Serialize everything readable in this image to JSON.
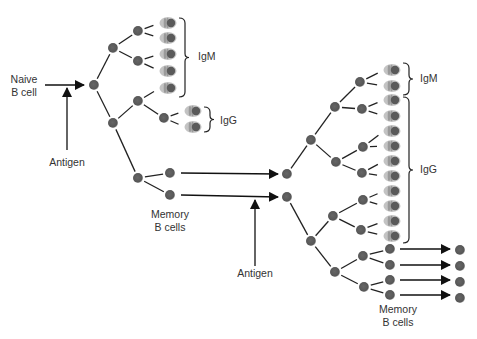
{
  "colors": {
    "node": "#5c5c5c",
    "plasma_body": "#bdbdbd",
    "plasma_stripe": "#9a9a9a",
    "plasma_nucleus": "#5a5a5a",
    "line": "#222222",
    "text": "#333333"
  },
  "labels": [
    {
      "id": "naive-label-1",
      "text": "Naive",
      "x": 24,
      "y": 83
    },
    {
      "id": "naive-label-2",
      "text": "B cell",
      "x": 24,
      "y": 96
    },
    {
      "id": "antigen-label-1",
      "text": "Antigen",
      "x": 67,
      "y": 166
    },
    {
      "id": "igm-label-1",
      "text": "IgM",
      "x": 198,
      "y": 60
    },
    {
      "id": "igg-label-1",
      "text": "IgG",
      "x": 220,
      "y": 124
    },
    {
      "id": "memory-label-1",
      "text": "Memory",
      "x": 170,
      "y": 218
    },
    {
      "id": "bcells-label-1",
      "text": "B cells",
      "x": 170,
      "y": 231
    },
    {
      "id": "antigen-label-2",
      "text": "Antigen",
      "x": 255,
      "y": 277
    },
    {
      "id": "igm-label-2",
      "text": "IgM",
      "x": 420,
      "y": 82
    },
    {
      "id": "igg-label-2",
      "text": "IgG",
      "x": 420,
      "y": 173
    },
    {
      "id": "memory-label-2",
      "text": "Memory",
      "x": 398,
      "y": 313
    },
    {
      "id": "bcells-label-2",
      "text": "B cells",
      "x": 398,
      "y": 326
    }
  ],
  "nodes": [
    {
      "id": "naive-b-cell",
      "x": 94,
      "y": 85
    },
    {
      "id": "p1",
      "x": 113,
      "y": 48
    },
    {
      "id": "p2",
      "x": 138,
      "y": 31
    },
    {
      "id": "p3",
      "x": 138,
      "y": 61
    },
    {
      "id": "p4",
      "x": 113,
      "y": 123
    },
    {
      "id": "p5",
      "x": 138,
      "y": 101
    },
    {
      "id": "p6",
      "x": 164,
      "y": 118
    },
    {
      "id": "m-parent",
      "x": 138,
      "y": 178
    },
    {
      "id": "memory-1a",
      "x": 170,
      "y": 173
    },
    {
      "id": "memory-1b",
      "x": 170,
      "y": 195
    },
    {
      "id": "s-top",
      "x": 287,
      "y": 174
    },
    {
      "id": "s-bot",
      "x": 287,
      "y": 197
    },
    {
      "id": "s1",
      "x": 311,
      "y": 140
    },
    {
      "id": "s2",
      "x": 335,
      "y": 107
    },
    {
      "id": "s3",
      "x": 360,
      "y": 82
    },
    {
      "id": "s4",
      "x": 362,
      "y": 109
    },
    {
      "id": "s5",
      "x": 336,
      "y": 162
    },
    {
      "id": "s6",
      "x": 363,
      "y": 147
    },
    {
      "id": "s7",
      "x": 362,
      "y": 173
    },
    {
      "id": "s8",
      "x": 311,
      "y": 241
    },
    {
      "id": "s9",
      "x": 333,
      "y": 216
    },
    {
      "id": "s10",
      "x": 363,
      "y": 200
    },
    {
      "id": "s11",
      "x": 361,
      "y": 230
    },
    {
      "id": "s12",
      "x": 335,
      "y": 272
    },
    {
      "id": "s13",
      "x": 363,
      "y": 256
    },
    {
      "id": "s14",
      "x": 364,
      "y": 287
    },
    {
      "id": "memory-2a",
      "x": 390,
      "y": 249
    },
    {
      "id": "memory-2b",
      "x": 390,
      "y": 265
    },
    {
      "id": "memory-2c",
      "x": 390,
      "y": 280
    },
    {
      "id": "memory-2d",
      "x": 390,
      "y": 295
    },
    {
      "id": "memory-3a",
      "x": 460,
      "y": 250
    },
    {
      "id": "memory-3b",
      "x": 460,
      "y": 266
    },
    {
      "id": "memory-3c",
      "x": 460,
      "y": 282
    },
    {
      "id": "memory-3d",
      "x": 460,
      "y": 298
    }
  ],
  "plasma_cells": [
    {
      "id": "pc1",
      "x": 168,
      "y": 23,
      "class": "IgM"
    },
    {
      "id": "pc2",
      "x": 168,
      "y": 38,
      "class": "IgM"
    },
    {
      "id": "pc3",
      "x": 168,
      "y": 54,
      "class": "IgM"
    },
    {
      "id": "pc4",
      "x": 168,
      "y": 71,
      "class": "IgM"
    },
    {
      "id": "pc5",
      "x": 168,
      "y": 88,
      "class": "IgM"
    },
    {
      "id": "pc6",
      "x": 193,
      "y": 111,
      "class": "IgG"
    },
    {
      "id": "pc7",
      "x": 193,
      "y": 127,
      "class": "IgG"
    },
    {
      "id": "pc8",
      "x": 392,
      "y": 70,
      "class": "IgM"
    },
    {
      "id": "pc9",
      "x": 392,
      "y": 86,
      "class": "IgM"
    },
    {
      "id": "pc10",
      "x": 392,
      "y": 100,
      "class": "IgG"
    },
    {
      "id": "pc11",
      "x": 392,
      "y": 116,
      "class": "IgG"
    },
    {
      "id": "pc12",
      "x": 392,
      "y": 131,
      "class": "IgG"
    },
    {
      "id": "pc13",
      "x": 392,
      "y": 146,
      "class": "IgG"
    },
    {
      "id": "pc14",
      "x": 392,
      "y": 161,
      "class": "IgG"
    },
    {
      "id": "pc15",
      "x": 392,
      "y": 176,
      "class": "IgG"
    },
    {
      "id": "pc16",
      "x": 392,
      "y": 191,
      "class": "IgG"
    },
    {
      "id": "pc17",
      "x": 392,
      "y": 206,
      "class": "IgG"
    },
    {
      "id": "pc18",
      "x": 392,
      "y": 221,
      "class": "IgG"
    },
    {
      "id": "pc19",
      "x": 392,
      "y": 236,
      "class": "IgG"
    }
  ],
  "edges": [
    [
      94,
      85,
      113,
      48
    ],
    [
      113,
      48,
      138,
      31
    ],
    [
      113,
      48,
      138,
      61
    ],
    [
      138,
      31,
      160,
      23
    ],
    [
      138,
      31,
      160,
      38
    ],
    [
      138,
      61,
      160,
      54
    ],
    [
      138,
      61,
      160,
      71
    ],
    [
      94,
      85,
      113,
      123
    ],
    [
      113,
      123,
      138,
      101
    ],
    [
      138,
      101,
      160,
      88
    ],
    [
      138,
      101,
      164,
      118
    ],
    [
      164,
      118,
      185,
      111
    ],
    [
      164,
      118,
      185,
      127
    ],
    [
      113,
      123,
      138,
      178
    ],
    [
      138,
      178,
      170,
      173
    ],
    [
      138,
      178,
      170,
      195
    ],
    [
      287,
      174,
      311,
      140
    ],
    [
      311,
      140,
      335,
      107
    ],
    [
      335,
      107,
      360,
      82
    ],
    [
      335,
      107,
      362,
      109
    ],
    [
      360,
      82,
      384,
      70
    ],
    [
      360,
      82,
      384,
      86
    ],
    [
      362,
      109,
      384,
      100
    ],
    [
      362,
      109,
      384,
      116
    ],
    [
      311,
      140,
      336,
      162
    ],
    [
      336,
      162,
      363,
      147
    ],
    [
      336,
      162,
      362,
      173
    ],
    [
      363,
      147,
      384,
      131
    ],
    [
      363,
      147,
      384,
      146
    ],
    [
      362,
      173,
      384,
      161
    ],
    [
      362,
      173,
      384,
      176
    ],
    [
      287,
      197,
      311,
      241
    ],
    [
      311,
      241,
      333,
      216
    ],
    [
      333,
      216,
      363,
      200
    ],
    [
      333,
      216,
      361,
      230
    ],
    [
      363,
      200,
      384,
      191
    ],
    [
      363,
      200,
      384,
      206
    ],
    [
      361,
      230,
      384,
      221
    ],
    [
      361,
      230,
      384,
      236
    ],
    [
      311,
      241,
      335,
      272
    ],
    [
      335,
      272,
      363,
      256
    ],
    [
      335,
      272,
      364,
      287
    ],
    [
      363,
      256,
      390,
      249
    ],
    [
      363,
      256,
      390,
      265
    ],
    [
      364,
      287,
      390,
      280
    ],
    [
      364,
      287,
      390,
      295
    ]
  ],
  "arrows": [
    {
      "id": "naive-arrow",
      "x1": 45,
      "y1": 85,
      "x2": 84,
      "y2": 85
    },
    {
      "id": "antigen-arrow-1",
      "x1": 67,
      "y1": 150,
      "x2": 67,
      "y2": 88
    },
    {
      "id": "memory-arrow-1",
      "x1": 181,
      "y1": 173,
      "x2": 278,
      "y2": 174
    },
    {
      "id": "memory-arrow-2",
      "x1": 181,
      "y1": 195,
      "x2": 278,
      "y2": 197
    },
    {
      "id": "antigen-arrow-2",
      "x1": 255,
      "y1": 266,
      "x2": 255,
      "y2": 200
    },
    {
      "id": "memory-arrow-3",
      "x1": 400,
      "y1": 249,
      "x2": 450,
      "y2": 249
    },
    {
      "id": "memory-arrow-4",
      "x1": 400,
      "y1": 265,
      "x2": 450,
      "y2": 265
    },
    {
      "id": "memory-arrow-5",
      "x1": 400,
      "y1": 280,
      "x2": 450,
      "y2": 280
    },
    {
      "id": "memory-arrow-6",
      "x1": 400,
      "y1": 295,
      "x2": 450,
      "y2": 295
    }
  ],
  "braces": [
    {
      "id": "igm-brace-1",
      "x": 179,
      "y1": 18,
      "y2": 97
    },
    {
      "id": "igg-brace-1",
      "x": 204,
      "y1": 107,
      "y2": 132
    },
    {
      "id": "igm-brace-2",
      "x": 403,
      "y1": 63,
      "y2": 95
    },
    {
      "id": "igg-brace-2",
      "x": 403,
      "y1": 97,
      "y2": 243
    }
  ]
}
